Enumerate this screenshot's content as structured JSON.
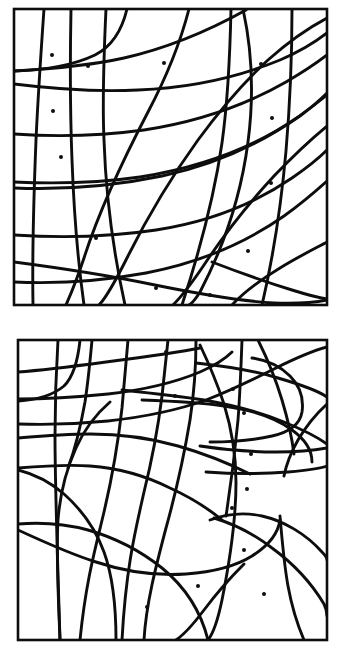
{
  "figure": {
    "name": "curved-cell-tessellation-figure",
    "background_color": "#ffffff",
    "ink_color": "#0d0d0d",
    "panel_count": 2,
    "canvas": {
      "width": 351,
      "height": 661
    }
  },
  "style": {
    "frame_stroke_width": 2.6,
    "curve_stroke_width": 2.9,
    "dot_radius": 2.0,
    "dot_color": "#0d0d0d",
    "curve_color": "#0d0d0d",
    "frame_color": "#0d0d0d",
    "fill_color": "#ffffff"
  },
  "panels": [
    {
      "id": "panel-top",
      "label": "top-panel",
      "frame": {
        "x": 14,
        "y": 9,
        "width": 313,
        "height": 296
      },
      "dot_count": 12,
      "dots": [
        {
          "x": 52,
          "y": 55
        },
        {
          "x": 88,
          "y": 66
        },
        {
          "x": 164,
          "y": 63
        },
        {
          "x": 261,
          "y": 64
        },
        {
          "x": 53,
          "y": 111
        },
        {
          "x": 272,
          "y": 118
        },
        {
          "x": 61,
          "y": 157
        },
        {
          "x": 271,
          "y": 183
        },
        {
          "x": 96,
          "y": 238
        },
        {
          "x": 248,
          "y": 251
        },
        {
          "x": 156,
          "y": 288
        },
        {
          "x": 210,
          "y": 295
        }
      ],
      "curves": [
        {
          "id": "t-v1",
          "d": "M 44 9 C 41 52, 38 96, 36 140 C 34 190, 32 248, 33 305"
        },
        {
          "id": "t-v2",
          "d": "M 71 9 C 70 60, 70 110, 72 160 C 74 215, 78 262, 84 305"
        },
        {
          "id": "t-v3",
          "d": "M 106 9 C 104 52, 102 96, 104 140 C 106 200, 114 255, 125 305"
        },
        {
          "id": "t-v4",
          "d": "M 127 9 C 122 30, 113 46, 95 55 C 72 66, 46 70, 14 71"
        },
        {
          "id": "t-v5",
          "d": "M 189 9 C 180 44, 166 78, 148 112 C 124 158, 100 208, 84 258 C 74 288, 68 300, 66 305"
        },
        {
          "id": "t-v6",
          "d": "M 231 9 C 230 55, 228 100, 222 143 C 214 198, 200 250, 182 305"
        },
        {
          "id": "t-v7",
          "d": "M 243 9 C 252 50, 254 96, 248 142 C 241 196, 224 246, 200 292 C 195 300, 191 304, 189 305"
        },
        {
          "id": "t-v8",
          "d": "M 292 9 C 292 56, 290 104, 286 151 C 281 207, 273 258, 262 305"
        },
        {
          "id": "t-h1",
          "d": "M 14 71 C 50 69, 88 66, 124 58 C 168 48, 210 30, 246 10"
        },
        {
          "id": "t-h2",
          "d": "M 14 84 C 54 89, 96 92, 138 90 C 186 88, 236 78, 280 60 C 304 50, 318 40, 327 33"
        },
        {
          "id": "t-h3",
          "d": "M 14 134 C 56 137, 100 136, 144 130 C 196 122, 244 106, 286 82 C 305 71, 318 62, 327 55"
        },
        {
          "id": "t-h4",
          "d": "M 14 182 C 56 184, 98 183, 140 177 C 190 169, 236 154, 276 131 C 300 117, 316 104, 327 95"
        },
        {
          "id": "t-h5",
          "d": "M 14 188 C 64 190, 114 186, 162 176 C 214 165, 260 144, 300 116 C 312 107, 321 99, 327 93"
        },
        {
          "id": "t-h6",
          "d": "M 14 235 C 62 238, 110 237, 156 230 C 208 222, 254 204, 292 178 C 308 167, 320 157, 327 150"
        },
        {
          "id": "t-h7",
          "d": "M 14 282 C 58 284, 102 281, 146 273 C 198 263, 244 244, 284 216 C 302 203, 317 190, 327 181"
        },
        {
          "id": "t-h8",
          "d": "M 14 262 C 60 268, 106 275, 150 284 C 194 293, 236 301, 274 303 C 300 304, 317 302, 327 300"
        },
        {
          "id": "t-arc1",
          "d": "M 327 18 C 308 28, 288 42, 268 60 C 244 82, 220 110, 198 140 C 172 176, 148 216, 128 256 C 114 284, 104 300, 99 305"
        },
        {
          "id": "t-arc2",
          "d": "M 327 126 C 310 140, 292 157, 274 176 C 250 202, 226 232, 206 262 C 192 283, 180 298, 173 305"
        },
        {
          "id": "t-arc3",
          "d": "M 327 242 C 312 250, 296 258, 280 268 C 262 279, 244 292, 232 305"
        },
        {
          "id": "t-arc4",
          "d": "M 212 262 C 238 272, 266 282, 292 290 C 308 295, 320 298, 327 299"
        }
      ]
    },
    {
      "id": "panel-bottom",
      "label": "bottom-panel",
      "frame": {
        "x": 18,
        "y": 340,
        "width": 309,
        "height": 300
      },
      "dot_count": 11,
      "dots": [
        {
          "x": 166,
          "y": 352
        },
        {
          "x": 233,
          "y": 389
        },
        {
          "x": 175,
          "y": 396
        },
        {
          "x": 244,
          "y": 413
        },
        {
          "x": 251,
          "y": 454
        },
        {
          "x": 247,
          "y": 489
        },
        {
          "x": 244,
          "y": 550
        },
        {
          "x": 198,
          "y": 586
        },
        {
          "x": 264,
          "y": 594
        },
        {
          "x": 147,
          "y": 607
        },
        {
          "x": 232,
          "y": 508
        }
      ],
      "curves": [
        {
          "id": "b-v1",
          "d": "M 58 340 C 56 372, 55 404, 55 436 C 55 484, 57 544, 60 640"
        },
        {
          "id": "b-v2",
          "d": "M 80 340 C 78 360, 74 376, 64 386 C 52 396, 36 400, 18 401"
        },
        {
          "id": "b-v3",
          "d": "M 92 340 C 90 362, 88 382, 85 402 C 80 430, 74 452, 68 468"
        },
        {
          "id": "b-v4",
          "d": "M 128 340 C 126 364, 124 386, 122 408 C 118 444, 112 478, 104 512 C 96 546, 86 580, 80 640"
        },
        {
          "id": "b-v5",
          "d": "M 168 340 C 166 360, 164 378, 162 396 C 158 428, 152 460, 144 492 C 136 528, 126 566, 122 640"
        },
        {
          "id": "b-v6",
          "d": "M 196 340 C 196 368, 194 394, 190 420 C 184 456, 176 492, 166 528 C 156 566, 146 604, 144 640"
        },
        {
          "id": "b-v7",
          "d": "M 200 345 C 210 366, 218 386, 224 404 C 232 430, 236 456, 236 482 C 236 520, 230 560, 222 600 C 217 624, 212 635, 208 640"
        },
        {
          "id": "b-v8",
          "d": "M 242 340 C 241 368, 240 394, 238 420 C 235 452, 231 484, 226 516"
        },
        {
          "id": "b-h1",
          "d": "M 18 372 C 46 370, 76 366, 106 362 C 144 357, 180 352, 200 348"
        },
        {
          "id": "b-h2",
          "d": "M 18 399 C 48 399, 78 397, 108 394 C 144 390, 176 382, 200 372 C 216 365, 226 358, 232 352"
        },
        {
          "id": "b-h3",
          "d": "M 18 424 C 48 425, 78 424, 108 421 C 144 417, 178 410, 206 400 C 232 390, 256 378, 276 368 C 300 356, 316 350, 327 347"
        },
        {
          "id": "b-h4",
          "d": "M 196 363 C 224 366, 252 370, 278 378 C 302 385, 320 392, 327 397"
        },
        {
          "id": "b-h5",
          "d": "M 122 390 C 150 393, 178 396, 204 400 C 232 405, 260 412, 284 422 C 306 431, 320 439, 327 444"
        },
        {
          "id": "b-h6",
          "d": "M 142 400 C 170 401, 198 402, 224 406 C 252 410, 276 418, 292 430 C 306 440, 312 450, 312 462"
        },
        {
          "id": "b-h7",
          "d": "M 210 442 C 232 442, 254 440, 272 436 C 290 432, 300 424, 302 412 C 304 398, 300 386, 290 376 C 280 366, 266 360, 252 358"
        },
        {
          "id": "b-h8",
          "d": "M 18 438 C 42 436, 66 434, 90 434 C 120 434, 150 438, 178 446 C 206 454, 230 464, 250 474"
        },
        {
          "id": "b-h9",
          "d": "M 200 446 C 226 450, 252 452, 276 452 C 300 452, 316 450, 327 448"
        },
        {
          "id": "b-h10",
          "d": "M 206 472 C 234 474, 262 474, 288 472 C 310 470, 322 468, 327 466"
        },
        {
          "id": "b-h11",
          "d": "M 18 468 C 42 466, 66 464, 90 466 C 118 468, 146 476, 170 488 C 192 498, 210 510, 222 520"
        },
        {
          "id": "b-arc1",
          "d": "M 18 470 C 34 474, 50 482, 64 494 C 82 510, 96 530, 104 552 C 112 574, 116 600, 116 640"
        },
        {
          "id": "b-arc2",
          "d": "M 110 402 C 96 414, 84 430, 76 448 C 66 470, 60 494, 58 520 C 56 552, 58 588, 60 640"
        },
        {
          "id": "b-arc3",
          "d": "M 18 524 C 42 522, 66 524, 88 530 C 116 538, 142 552, 162 568 C 184 586, 200 608, 208 640"
        },
        {
          "id": "b-arc4",
          "d": "M 18 530 C 44 542, 70 554, 96 562 C 126 572, 156 576, 186 574 C 214 572, 236 566, 252 556 C 268 546, 278 534, 280 520"
        },
        {
          "id": "b-arc5",
          "d": "M 210 520 C 226 514, 244 512, 262 516 C 284 521, 306 534, 322 552 C 326 556, 327 558, 327 560"
        },
        {
          "id": "b-arc6",
          "d": "M 214 518 C 234 524, 254 534, 272 548 C 294 564, 312 584, 324 604 C 327 610, 327 614, 327 616"
        },
        {
          "id": "b-arc7",
          "d": "M 280 516 C 282 540, 284 564, 288 586 C 292 608, 298 626, 304 640"
        },
        {
          "id": "b-arc8",
          "d": "M 258 340 C 268 360, 276 380, 282 400 C 288 420, 292 438, 294 454"
        },
        {
          "id": "b-arc9",
          "d": "M 327 404 C 316 414, 306 426, 298 440 C 290 454, 286 466, 284 476"
        },
        {
          "id": "b-arc10",
          "d": "M 244 564 C 230 578, 216 594, 204 610 C 192 626, 182 636, 176 640"
        }
      ]
    }
  ]
}
